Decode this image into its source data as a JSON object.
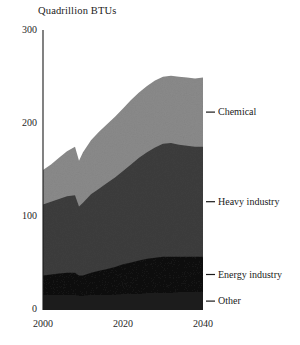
{
  "chart_data": {
    "type": "area",
    "title": "Quadrillion BTUs",
    "subtitle": "",
    "xlabel": "",
    "ylabel": "Quadrillion BTUs",
    "stacked": true,
    "grid": false,
    "legend_position": "right-inline",
    "xlim": [
      2000,
      2040
    ],
    "ylim": [
      0,
      300
    ],
    "ytick_labels": [
      "300",
      "200",
      "100",
      "0"
    ],
    "ytick_values": [
      300,
      200,
      100,
      0
    ],
    "xtick_labels": [
      "2000",
      "2020",
      "2040"
    ],
    "xtick_values": [
      2000,
      2020,
      2040
    ],
    "x": [
      2000,
      2002,
      2004,
      2006,
      2008,
      2009,
      2010,
      2012,
      2014,
      2016,
      2018,
      2020,
      2022,
      2024,
      2026,
      2028,
      2030,
      2032,
      2034,
      2036,
      2038,
      2040
    ],
    "series": [
      {
        "name": "Other",
        "color": "#1f1f1f",
        "order": 1,
        "values": [
          16,
          16,
          16,
          16,
          16,
          15,
          15,
          16,
          16,
          16,
          16,
          17,
          17,
          17,
          18,
          18,
          18,
          18,
          19,
          19,
          19,
          19
        ]
      },
      {
        "name": "Energy industry",
        "color": "#121212",
        "order": 2,
        "values": [
          21,
          22,
          23,
          24,
          24,
          22,
          22,
          24,
          26,
          28,
          30,
          32,
          34,
          36,
          37,
          38,
          39,
          39,
          38,
          38,
          38,
          38
        ]
      },
      {
        "name": "Heavy industry",
        "color": "#3d3d3d",
        "order": 3,
        "values": [
          76,
          78,
          80,
          82,
          83,
          74,
          78,
          84,
          88,
          92,
          96,
          100,
          105,
          110,
          114,
          118,
          121,
          122,
          120,
          119,
          118,
          118
        ]
      },
      {
        "name": "Chemical",
        "color": "#8a8a8a",
        "order": 4,
        "values": [
          37,
          40,
          44,
          48,
          52,
          49,
          54,
          58,
          61,
          63,
          65,
          67,
          69,
          70,
          71,
          72,
          72,
          72,
          73,
          73,
          73,
          74
        ]
      }
    ],
    "series_totals": {
      "2000": 150,
      "2010": 169,
      "2020": 216,
      "2030": 250,
      "2040": 249
    },
    "annotations": [
      {
        "label": "Chemical",
        "series": "Chemical"
      },
      {
        "label": "Heavy industry",
        "series": "Heavy industry"
      },
      {
        "label": "Energy industry",
        "series": "Energy industry"
      },
      {
        "label": "Other",
        "series": "Other"
      }
    ]
  },
  "axis": {
    "title": "Quadrillion BTUs",
    "y_ticks": [
      {
        "label": "300"
      },
      {
        "label": "200"
      },
      {
        "label": "100"
      },
      {
        "label": "0"
      }
    ],
    "x_ticks": [
      {
        "label": "2000"
      },
      {
        "label": "2020"
      },
      {
        "label": "2040"
      }
    ]
  },
  "legend": {
    "items": [
      {
        "label": "Chemical"
      },
      {
        "label": "Heavy industry"
      },
      {
        "label": "Energy industry"
      },
      {
        "label": "Other"
      }
    ]
  },
  "colors": {
    "chemical": "#8a8a8a",
    "heavy_industry": "#3d3d3d",
    "energy_industry": "#121212",
    "other": "#1f1f1f",
    "axis": "#1a1a1a",
    "background": "#ffffff"
  }
}
